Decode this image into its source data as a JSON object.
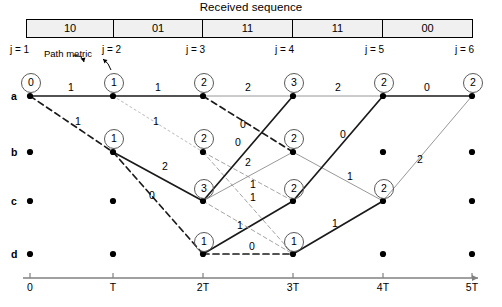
{
  "header": {
    "title": "Received sequence",
    "cells": [
      {
        "label": "10",
        "x": 26,
        "w": 88
      },
      {
        "label": "01",
        "x": 114,
        "w": 89
      },
      {
        "label": "11",
        "x": 203,
        "w": 90
      },
      {
        "label": "11",
        "x": 293,
        "w": 90
      },
      {
        "label": "00",
        "x": 383,
        "w": 90
      }
    ]
  },
  "annotations": {
    "path_metric": "Path metric"
  },
  "stage_labels": [
    {
      "label": "j = 1",
      "x": 10,
      "y": 44
    },
    {
      "label": "j = 2",
      "x": 102,
      "y": 44
    },
    {
      "label": "j = 3",
      "x": 186,
      "y": 44
    },
    {
      "label": "j = 4",
      "x": 275,
      "y": 44
    },
    {
      "label": "j = 5",
      "x": 365,
      "y": 44
    },
    {
      "label": "j = 6",
      "x": 455,
      "y": 44
    }
  ],
  "state_labels": [
    {
      "label": "a",
      "x": 11,
      "y": 90
    },
    {
      "label": "b",
      "x": 11,
      "y": 146
    },
    {
      "label": "c",
      "x": 11,
      "y": 195
    },
    {
      "label": "d",
      "x": 11,
      "y": 248
    }
  ],
  "time_axis": {
    "y": 278,
    "x_start": 23,
    "x_end": 478,
    "ticks": [
      {
        "label": "0",
        "x": 30
      },
      {
        "label": "T",
        "x": 113
      },
      {
        "label": "2T",
        "x": 203
      },
      {
        "label": "3T",
        "x": 293
      },
      {
        "label": "4T",
        "x": 383
      },
      {
        "label": "5T",
        "x": 472
      }
    ]
  },
  "trellis": {
    "columns_x": [
      30,
      113,
      203,
      293,
      383,
      472
    ],
    "rows_y": {
      "a": 96,
      "b": 152,
      "c": 201,
      "d": 254
    },
    "nodes": [
      {
        "stage": 1,
        "state": "a",
        "x": 30,
        "y": 96
      },
      {
        "stage": 1,
        "state": "b",
        "x": 30,
        "y": 152
      },
      {
        "stage": 1,
        "state": "c",
        "x": 30,
        "y": 201
      },
      {
        "stage": 1,
        "state": "d",
        "x": 30,
        "y": 254
      },
      {
        "stage": 2,
        "state": "a",
        "x": 113,
        "y": 96
      },
      {
        "stage": 2,
        "state": "b",
        "x": 113,
        "y": 152
      },
      {
        "stage": 2,
        "state": "c",
        "x": 113,
        "y": 201
      },
      {
        "stage": 2,
        "state": "d",
        "x": 113,
        "y": 254
      },
      {
        "stage": 3,
        "state": "a",
        "x": 203,
        "y": 96
      },
      {
        "stage": 3,
        "state": "b",
        "x": 203,
        "y": 152
      },
      {
        "stage": 3,
        "state": "c",
        "x": 203,
        "y": 201
      },
      {
        "stage": 3,
        "state": "d",
        "x": 203,
        "y": 254
      },
      {
        "stage": 4,
        "state": "a",
        "x": 293,
        "y": 96
      },
      {
        "stage": 4,
        "state": "b",
        "x": 293,
        "y": 152
      },
      {
        "stage": 4,
        "state": "c",
        "x": 293,
        "y": 201
      },
      {
        "stage": 4,
        "state": "d",
        "x": 293,
        "y": 254
      },
      {
        "stage": 5,
        "state": "a",
        "x": 383,
        "y": 96
      },
      {
        "stage": 5,
        "state": "b",
        "x": 383,
        "y": 152
      },
      {
        "stage": 5,
        "state": "c",
        "x": 383,
        "y": 201
      },
      {
        "stage": 5,
        "state": "d",
        "x": 383,
        "y": 254
      },
      {
        "stage": 6,
        "state": "a",
        "x": 472,
        "y": 96
      },
      {
        "stage": 6,
        "state": "b",
        "x": 472,
        "y": 152
      },
      {
        "stage": 6,
        "state": "c",
        "x": 472,
        "y": 201
      },
      {
        "stage": 6,
        "state": "d",
        "x": 472,
        "y": 254
      }
    ],
    "metrics": [
      {
        "value": "0",
        "stage": 1,
        "state": "a",
        "x": 30,
        "y": 82
      },
      {
        "value": "1",
        "stage": 2,
        "state": "a",
        "x": 113,
        "y": 82
      },
      {
        "value": "1",
        "stage": 2,
        "state": "b",
        "x": 113,
        "y": 138
      },
      {
        "value": "2",
        "stage": 3,
        "state": "a",
        "x": 203,
        "y": 82
      },
      {
        "value": "2",
        "stage": 3,
        "state": "b",
        "x": 203,
        "y": 138
      },
      {
        "value": "3",
        "stage": 3,
        "state": "c",
        "x": 203,
        "y": 188
      },
      {
        "value": "1",
        "stage": 3,
        "state": "d",
        "x": 203,
        "y": 241
      },
      {
        "value": "3",
        "stage": 4,
        "state": "a",
        "x": 293,
        "y": 82
      },
      {
        "value": "2",
        "stage": 4,
        "state": "b",
        "x": 293,
        "y": 138
      },
      {
        "value": "2",
        "stage": 4,
        "state": "c",
        "x": 293,
        "y": 188
      },
      {
        "value": "1",
        "stage": 4,
        "state": "d",
        "x": 293,
        "y": 241
      },
      {
        "value": "2",
        "stage": 5,
        "state": "a",
        "x": 383,
        "y": 82
      },
      {
        "value": "2",
        "stage": 5,
        "state": "c",
        "x": 383,
        "y": 188
      },
      {
        "value": "2",
        "stage": 6,
        "state": "a",
        "x": 472,
        "y": 82
      }
    ],
    "edges": [
      {
        "from": {
          "stage": 1,
          "state": "a"
        },
        "to": {
          "stage": 2,
          "state": "a"
        },
        "style": "solid-bold",
        "label": "1",
        "lx": 71,
        "ly": 88
      },
      {
        "from": {
          "stage": 1,
          "state": "a"
        },
        "to": {
          "stage": 2,
          "state": "b"
        },
        "style": "dashed-bold",
        "label": "1",
        "lx": 78,
        "ly": 122
      },
      {
        "from": {
          "stage": 2,
          "state": "a"
        },
        "to": {
          "stage": 3,
          "state": "a"
        },
        "style": "solid-bold",
        "label": "1",
        "lx": 158,
        "ly": 88
      },
      {
        "from": {
          "stage": 2,
          "state": "a"
        },
        "to": {
          "stage": 3,
          "state": "b"
        },
        "style": "dotted-light",
        "label": "1",
        "lx": 156,
        "ly": 122
      },
      {
        "from": {
          "stage": 2,
          "state": "b"
        },
        "to": {
          "stage": 3,
          "state": "c"
        },
        "style": "solid-bold",
        "label": "2",
        "lx": 165,
        "ly": 167
      },
      {
        "from": {
          "stage": 2,
          "state": "b"
        },
        "to": {
          "stage": 3,
          "state": "d"
        },
        "style": "dashed-bold",
        "label": "0",
        "lx": 152,
        "ly": 196
      },
      {
        "from": {
          "stage": 3,
          "state": "a"
        },
        "to": {
          "stage": 4,
          "state": "a"
        },
        "style": "solid-light",
        "label": "2",
        "lx": 248,
        "ly": 88
      },
      {
        "from": {
          "stage": 3,
          "state": "a"
        },
        "to": {
          "stage": 4,
          "state": "b"
        },
        "style": "dashed-bold",
        "label": "0",
        "lx": 243,
        "ly": 125
      },
      {
        "from": {
          "stage": 3,
          "state": "b"
        },
        "to": {
          "stage": 4,
          "state": "c"
        },
        "style": "dashed-light",
        "label": "2",
        "lx": 248,
        "ly": 163
      },
      {
        "from": {
          "stage": 3,
          "state": "b"
        },
        "to": {
          "stage": 4,
          "state": "d"
        },
        "style": "dashed-light",
        "label": "",
        "lx": 0,
        "ly": 0
      },
      {
        "from": {
          "stage": 3,
          "state": "c"
        },
        "to": {
          "stage": 4,
          "state": "a"
        },
        "style": "solid-bold",
        "label": "0",
        "lx": 238,
        "ly": 143
      },
      {
        "from": {
          "stage": 3,
          "state": "c"
        },
        "to": {
          "stage": 4,
          "state": "b"
        },
        "style": "solid-light",
        "label": "1",
        "lx": 253,
        "ly": 185
      },
      {
        "from": {
          "stage": 3,
          "state": "d"
        },
        "to": {
          "stage": 4,
          "state": "c"
        },
        "style": "solid-bold",
        "label": "1",
        "lx": 240,
        "ly": 226
      },
      {
        "from": {
          "stage": 3,
          "state": "d"
        },
        "to": {
          "stage": 4,
          "state": "d"
        },
        "style": "dashed-bold",
        "label": "0",
        "lx": 252,
        "ly": 247
      },
      {
        "from": {
          "stage": 3,
          "state": "c"
        },
        "to": {
          "stage": 4,
          "state": "d"
        },
        "style": "dashed-light",
        "label": "1",
        "lx": 253,
        "ly": 198
      },
      {
        "from": {
          "stage": 4,
          "state": "a"
        },
        "to": {
          "stage": 5,
          "state": "a"
        },
        "style": "solid-light",
        "label": "2",
        "lx": 338,
        "ly": 88
      },
      {
        "from": {
          "stage": 4,
          "state": "b"
        },
        "to": {
          "stage": 5,
          "state": "c"
        },
        "style": "solid-light",
        "label": "1",
        "lx": 350,
        "ly": 177
      },
      {
        "from": {
          "stage": 4,
          "state": "c"
        },
        "to": {
          "stage": 5,
          "state": "a"
        },
        "style": "solid-bold",
        "label": "0",
        "lx": 343,
        "ly": 135
      },
      {
        "from": {
          "stage": 4,
          "state": "d"
        },
        "to": {
          "stage": 5,
          "state": "c"
        },
        "style": "solid-bold",
        "label": "1",
        "lx": 335,
        "ly": 224
      },
      {
        "from": {
          "stage": 5,
          "state": "a"
        },
        "to": {
          "stage": 6,
          "state": "a"
        },
        "style": "solid-bold",
        "label": "0",
        "lx": 427,
        "ly": 88
      },
      {
        "from": {
          "stage": 5,
          "state": "c"
        },
        "to": {
          "stage": 6,
          "state": "a"
        },
        "style": "solid-light",
        "label": "2",
        "lx": 420,
        "ly": 160
      }
    ]
  }
}
